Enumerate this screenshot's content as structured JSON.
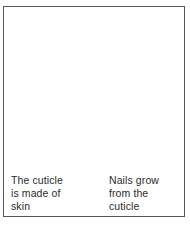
{
  "figure": {
    "background_color": "#ffffff",
    "border_color": "#58585a"
  },
  "colors": {
    "skin": "#dcdcdc",
    "skin_shadow": "#c9c9c9",
    "skin_highlight": "#eeeeee",
    "nail": "#f7f7f7",
    "nail_highlight": "#fdfdfd",
    "nail_shadow": "#e2e2e2",
    "outline": "#a8a8a8",
    "leader_line": "#1d1d1d",
    "text": "#2b2b2b"
  },
  "labels": {
    "cuticle": {
      "name": "cuticle-label",
      "lines": [
        "The cuticle",
        "is made of",
        "skin"
      ],
      "line1": "The cuticle",
      "line2": "is made of",
      "line3": "skin"
    },
    "growth": {
      "name": "nail-growth-label",
      "lines": [
        "Nails grow",
        "from the",
        "cuticle"
      ],
      "line1": "Nails grow",
      "line2": "from the",
      "line3": "cuticle"
    }
  },
  "leader_lines": [
    {
      "name": "leader-line-cuticle",
      "from": [
        72,
        136
      ],
      "to": [
        55,
        172
      ]
    },
    {
      "name": "leader-line-growth",
      "from": [
        103,
        136
      ],
      "to": [
        120,
        172
      ]
    }
  ],
  "parts": [
    {
      "name": "finger",
      "description": "fingertip seen from above, flaring toward the bottom"
    },
    {
      "name": "fingernail",
      "description": "rounded nail plate occupying the upper centre of the fingertip"
    },
    {
      "name": "cuticle",
      "description": "curved fold of skin at the base of the nail"
    }
  ]
}
